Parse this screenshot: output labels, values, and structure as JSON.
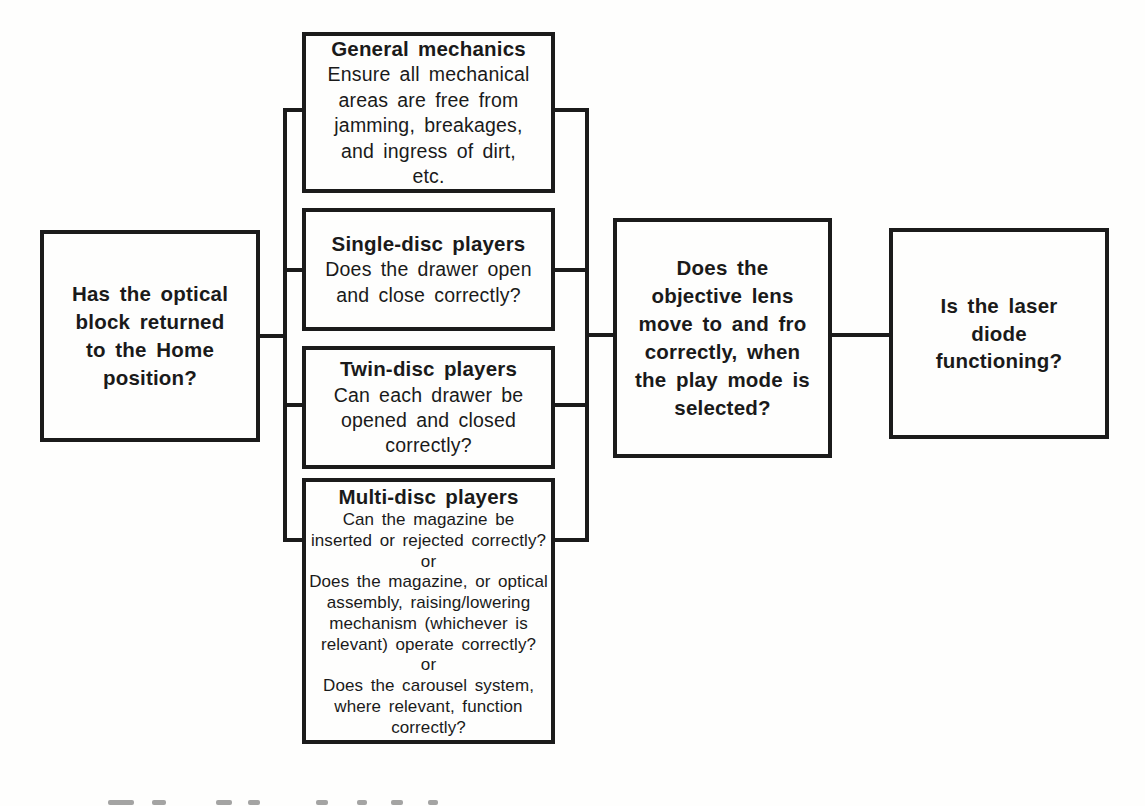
{
  "figure": {
    "type": "flowchart",
    "background_color": "#fefefd",
    "ink_color": "#1b1b1b"
  },
  "nodes": {
    "optical_block": {
      "lines": [
        "Has the optical",
        "block returned",
        "to the Home",
        "position?"
      ]
    },
    "general_mechanics": {
      "heading": "General mechanics",
      "body": [
        "Ensure all mechanical",
        "areas are free from",
        "jamming, breakages,",
        "and ingress of dirt,",
        "etc."
      ]
    },
    "single_disc": {
      "heading": "Single-disc players",
      "body": [
        "Does the drawer open",
        "and close correctly?"
      ]
    },
    "twin_disc": {
      "heading": "Twin-disc players",
      "body": [
        "Can each drawer be",
        "opened and closed",
        "correctly?"
      ]
    },
    "multi_disc": {
      "heading": "Multi-disc players",
      "body": [
        "Can the magazine be",
        "inserted or rejected correctly?",
        "or",
        "Does the magazine, or optical",
        "assembly, raising/lowering",
        "mechanism (whichever is",
        "relevant) operate correctly?",
        "or",
        "Does the carousel system,",
        "where relevant, function",
        "correctly?"
      ]
    },
    "objective_lens": {
      "lines": [
        "Does the",
        "objective lens",
        "move to and fro",
        "correctly, when",
        "the play mode is",
        "selected?"
      ]
    },
    "laser_diode": {
      "lines": [
        "Is the laser",
        "diode",
        "functioning?"
      ]
    }
  }
}
